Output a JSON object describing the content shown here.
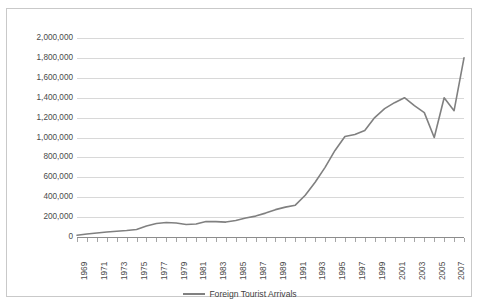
{
  "chart_data": {
    "type": "line",
    "title": "",
    "xlabel": "",
    "ylabel": "",
    "ylim": [
      0,
      2000000
    ],
    "ytick_labels": [
      "2,000,000",
      "1,800,000",
      "1,600,000",
      "1,400,000",
      "1,200,000",
      "1,000,000",
      "800,000",
      "600,000",
      "400,000",
      "200,000",
      "0"
    ],
    "ytick_values": [
      2000000,
      1800000,
      1600000,
      1400000,
      1200000,
      1000000,
      800000,
      600000,
      400000,
      200000,
      0
    ],
    "grid": true,
    "legend_position": "bottom",
    "legend": [
      "Foreign Tourist Arrivals"
    ],
    "line_color": "#808080",
    "xtick_labels": [
      "1969",
      "1971",
      "1973",
      "1975",
      "1977",
      "1979",
      "1981",
      "1983",
      "1985",
      "1987",
      "1989",
      "1991",
      "1993",
      "1995",
      "1997",
      "1999",
      "2001",
      "2003",
      "2005",
      "2007"
    ],
    "x": [
      1969,
      1970,
      1971,
      1972,
      1973,
      1974,
      1975,
      1976,
      1977,
      1978,
      1979,
      1980,
      1981,
      1982,
      1983,
      1984,
      1985,
      1986,
      1987,
      1988,
      1989,
      1990,
      1991,
      1992,
      1993,
      1994,
      1995,
      1996,
      1997,
      1998,
      1999,
      2000,
      2001,
      2002,
      2003,
      2004,
      2005,
      2006,
      2007,
      2008
    ],
    "series": [
      {
        "name": "Foreign Tourist Arrivals",
        "values": [
          18000,
          30000,
          40000,
          50000,
          58000,
          65000,
          75000,
          110000,
          135000,
          145000,
          140000,
          125000,
          130000,
          155000,
          155000,
          150000,
          165000,
          190000,
          210000,
          240000,
          275000,
          300000,
          320000,
          420000,
          550000,
          700000,
          870000,
          1010000,
          1030000,
          1070000,
          1200000,
          1290000,
          1350000,
          1400000,
          1320000,
          1250000,
          1000000,
          1400000,
          1270000,
          1800000
        ]
      }
    ]
  }
}
